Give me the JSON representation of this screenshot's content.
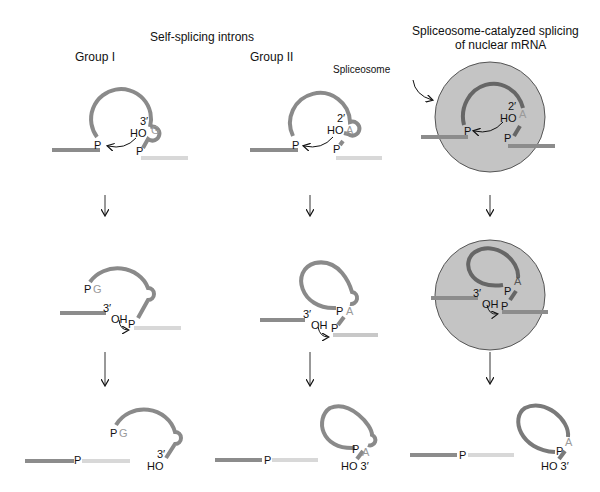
{
  "headers": {
    "self_splicing": "Self-splicing introns",
    "group1": "Group I",
    "group2": "Group II",
    "spliceosome_line1": "Spliceosome-catalyzed splicing",
    "spliceosome_line2": "of nuclear mRNA",
    "spliceosome_label": "Spliceosome"
  },
  "labels": {
    "three_prime": "3′",
    "two_prime": "2′",
    "ho": "HO",
    "oh": "OH",
    "p": "P",
    "g": "G",
    "a": "A",
    "ho_3": "HO 3′"
  },
  "colors": {
    "intron": "#8a8a8a",
    "exon_left": "#8c8c8c",
    "exon_right": "#d0d0d0",
    "spliceosome_fill": "#c4c4c4",
    "spliceosome_stroke": "#555555",
    "nucleotide_letter": "#9a9a9a",
    "text": "#111111"
  },
  "columns": [
    {
      "name": "Group I",
      "stages": [
        "initial attack by G 3′-OH",
        "exon 1 3′-OH attacks",
        "spliced exons + linear intron"
      ]
    },
    {
      "name": "Group II",
      "stages": [
        "2′-OH of A attacks",
        "exon 1 3′-OH attacks",
        "spliced exons + lariat"
      ]
    },
    {
      "name": "Spliceosome",
      "stages": [
        "2′-OH of A attacks",
        "exon 1 3′-OH attacks",
        "spliced exons + lariat"
      ]
    }
  ]
}
